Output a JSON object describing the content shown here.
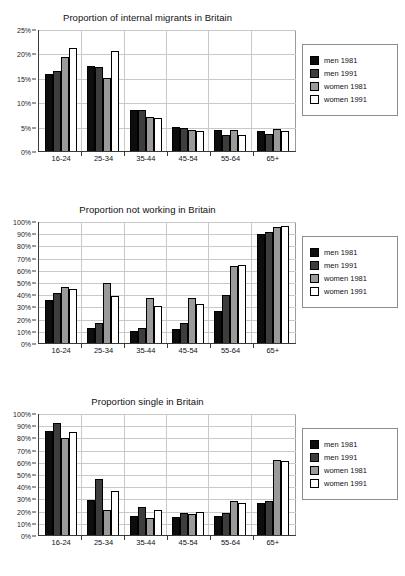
{
  "series_names": [
    "men 1981",
    "men 1991",
    "women 1981",
    "women 1991"
  ],
  "series_colors": [
    "#0d0d0d",
    "#3d3d3d",
    "#9a9a9a",
    "#ffffff"
  ],
  "categories": [
    "16-24",
    "25-34",
    "35-44",
    "45-54",
    "55-64",
    "65+"
  ],
  "charts": [
    {
      "title": "Proportion of internal migrants in Britain",
      "ytick_labels": [
        "0%",
        "5%",
        "10%",
        "15%",
        "20%",
        "25%"
      ]
    },
    {
      "title": "Proportion not working in Britain",
      "ytick_labels": [
        "0%",
        "10%",
        "20%",
        "30%",
        "40%",
        "50%",
        "60%",
        "70%",
        "80%",
        "90%",
        "100%"
      ]
    },
    {
      "title": "Proportion single in Britain",
      "ytick_labels": [
        "0%",
        "10%",
        "20%",
        "30%",
        "40%",
        "50%",
        "60%",
        "70%",
        "80%",
        "90%",
        "100%"
      ]
    }
  ],
  "chart_data": [
    {
      "type": "bar",
      "title": "Proportion of internal migrants in Britain",
      "xlabel": "",
      "ylabel": "",
      "ylim": [
        0,
        25
      ],
      "yticks": [
        0,
        5,
        10,
        15,
        20,
        25
      ],
      "ytick_labels": [
        "0%",
        "5%",
        "10%",
        "15%",
        "20%",
        "25%"
      ],
      "grid": true,
      "legend_position": "right",
      "categories": [
        "16-24",
        "25-34",
        "35-44",
        "45-54",
        "55-64",
        "65+"
      ],
      "series": [
        {
          "name": "men 1981",
          "values": [
            15.9,
            17.6,
            8.7,
            5.1,
            4.5,
            4.4
          ]
        },
        {
          "name": "men 1991",
          "values": [
            16.6,
            17.5,
            8.6,
            5.0,
            3.5,
            3.6
          ]
        },
        {
          "name": "women 1981",
          "values": [
            19.4,
            15.2,
            7.2,
            4.6,
            4.5,
            4.8
          ]
        },
        {
          "name": "women 1991",
          "values": [
            21.4,
            20.8,
            7.0,
            4.3,
            3.5,
            4.3
          ]
        }
      ]
    },
    {
      "type": "bar",
      "title": "Proportion not working in Britain",
      "xlabel": "",
      "ylabel": "",
      "ylim": [
        0,
        100
      ],
      "yticks": [
        0,
        10,
        20,
        30,
        40,
        50,
        60,
        70,
        80,
        90,
        100
      ],
      "ytick_labels": [
        "0%",
        "10%",
        "20%",
        "30%",
        "40%",
        "50%",
        "60%",
        "70%",
        "80%",
        "90%",
        "100%"
      ],
      "grid": true,
      "legend_position": "right",
      "categories": [
        "16-24",
        "25-34",
        "35-44",
        "45-54",
        "55-64",
        "65+"
      ],
      "series": [
        {
          "name": "men 1981",
          "values": [
            36,
            13.5,
            11,
            12.5,
            27,
            90
          ]
        },
        {
          "name": "men 1991",
          "values": [
            42,
            17,
            13.5,
            17,
            40,
            92
          ]
        },
        {
          "name": "women 1981",
          "values": [
            46.5,
            50,
            38,
            37.5,
            64,
            96
          ]
        },
        {
          "name": "women 1991",
          "values": [
            45.5,
            39,
            31,
            33,
            65,
            96.5
          ]
        }
      ]
    },
    {
      "type": "bar",
      "title": "Proportion single in Britain",
      "xlabel": "",
      "ylabel": "",
      "ylim": [
        0,
        100
      ],
      "yticks": [
        0,
        10,
        20,
        30,
        40,
        50,
        60,
        70,
        80,
        90,
        100
      ],
      "ytick_labels": [
        "0%",
        "10%",
        "20%",
        "30%",
        "40%",
        "50%",
        "60%",
        "70%",
        "80%",
        "90%",
        "100%"
      ],
      "grid": true,
      "legend_position": "right",
      "categories": [
        "16-24",
        "25-34",
        "35-44",
        "45-54",
        "55-64",
        "65+"
      ],
      "series": [
        {
          "name": "men 1981",
          "values": [
            86,
            29.5,
            16,
            15.5,
            16,
            27
          ]
        },
        {
          "name": "men 1991",
          "values": [
            93,
            47,
            23.5,
            19,
            18.5,
            28.5
          ]
        },
        {
          "name": "women 1981",
          "values": [
            80,
            21,
            15,
            18,
            28.5,
            62.5
          ]
        },
        {
          "name": "women 1991",
          "values": [
            85,
            37,
            21.5,
            20,
            27,
            61.5
          ]
        }
      ]
    }
  ]
}
